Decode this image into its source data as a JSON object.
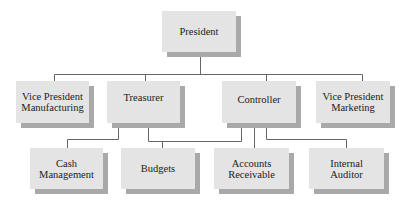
{
  "org_chart": {
    "president": {
      "label": "President"
    },
    "level2": [
      {
        "id": "vp-manufacturing",
        "lines": [
          "Vice President",
          "Manufacturing"
        ]
      },
      {
        "id": "treasurer",
        "lines": [
          "Treasurer"
        ]
      },
      {
        "id": "controller",
        "lines": [
          "Controller"
        ]
      },
      {
        "id": "vp-marketing",
        "lines": [
          "Vice President",
          "Marketing"
        ]
      }
    ],
    "level3": [
      {
        "id": "cash-management",
        "lines": [
          "Cash",
          "Management"
        ],
        "reports_to": "treasurer"
      },
      {
        "id": "budgets",
        "lines": [
          "Budgets"
        ],
        "reports_to": "treasurer, controller"
      },
      {
        "id": "accounts-receivable",
        "lines": [
          "Accounts",
          "Receivable"
        ],
        "reports_to": "controller"
      },
      {
        "id": "internal-auditor",
        "lines": [
          "Internal",
          "Auditor"
        ],
        "reports_to": "controller"
      }
    ]
  },
  "colors": {
    "box_face": "#e4e4e4",
    "box_shadow": "#a9a9a9",
    "connector": "#666666",
    "text": "#222222"
  }
}
